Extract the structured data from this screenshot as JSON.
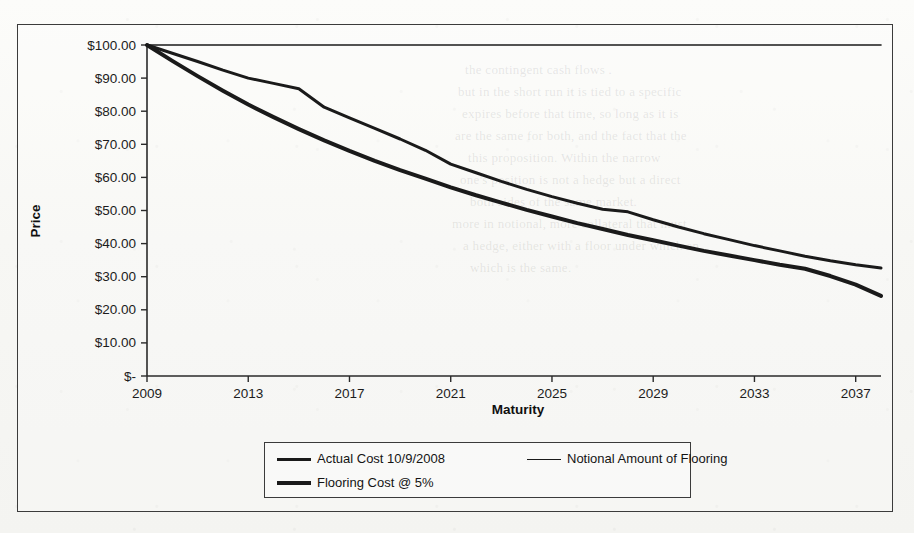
{
  "chart_data": {
    "type": "line",
    "title": "",
    "xlabel": "Maturity",
    "ylabel": "Price",
    "grid": false,
    "legend_position": "bottom",
    "xlim": [
      2009,
      2038
    ],
    "ylim": [
      0,
      100
    ],
    "x_tick_labels": [
      "2009",
      "2013",
      "2017",
      "2021",
      "2025",
      "2029",
      "2033",
      "2037"
    ],
    "x_tick_values": [
      2009,
      2013,
      2017,
      2021,
      2025,
      2029,
      2033,
      2037
    ],
    "y_tick_labels": [
      "$-",
      "$10.00",
      "$20.00",
      "$30.00",
      "$40.00",
      "$50.00",
      "$60.00",
      "$70.00",
      "$80.00",
      "$90.00",
      "$100.00"
    ],
    "y_tick_values": [
      0,
      10,
      20,
      30,
      40,
      50,
      60,
      70,
      80,
      90,
      100
    ],
    "x": [
      2009,
      2010,
      2011,
      2012,
      2013,
      2014,
      2015,
      2016,
      2017,
      2018,
      2019,
      2020,
      2021,
      2022,
      2023,
      2024,
      2025,
      2026,
      2027,
      2028,
      2029,
      2030,
      2031,
      2032,
      2033,
      2034,
      2035,
      2036,
      2037,
      2038
    ],
    "series": [
      {
        "name": "Actual Cost 10/9/2008",
        "style": "medium",
        "values": [
          100.0,
          97.5,
          95.0,
          92.4,
          90.0,
          88.4,
          86.8,
          81.2,
          78.0,
          74.8,
          71.6,
          68.2,
          64.0,
          61.4,
          58.8,
          56.4,
          54.2,
          52.2,
          50.4,
          49.6,
          47.2,
          45.0,
          43.0,
          41.2,
          39.4,
          37.8,
          36.2,
          34.8,
          33.6,
          32.6
        ]
      },
      {
        "name": "Notional Amount of Flooring",
        "style": "thin",
        "values": [
          100.0,
          100.0,
          100.0,
          100.0,
          100.0,
          100.0,
          100.0,
          100.0,
          100.0,
          100.0,
          100.0,
          100.0,
          100.0,
          100.0,
          100.0,
          100.0,
          100.0,
          100.0,
          100.0,
          100.0,
          100.0,
          100.0,
          100.0,
          100.0,
          100.0,
          100.0,
          100.0,
          100.0,
          100.0,
          100.0
        ]
      },
      {
        "name": "Flooring Cost @ 5%",
        "style": "thick",
        "values": [
          100.0,
          95.2,
          90.6,
          86.2,
          82.0,
          78.2,
          74.6,
          71.2,
          68.0,
          65.0,
          62.2,
          59.6,
          57.0,
          54.6,
          52.4,
          50.2,
          48.2,
          46.2,
          44.4,
          42.6,
          41.0,
          39.4,
          37.8,
          36.4,
          35.0,
          33.6,
          32.4,
          30.2,
          27.6,
          24.2
        ]
      }
    ]
  },
  "legend": {
    "entries": [
      {
        "label": "Actual Cost 10/9/2008",
        "swatch": "line-medium"
      },
      {
        "label": "Notional Amount of Flooring",
        "swatch": "line-thin"
      },
      {
        "label": "Flooring Cost @ 5%",
        "swatch": "line-thick"
      }
    ]
  },
  "colors": {
    "line": "#1a1a1a",
    "axis": "#2a2a2a",
    "border": "#3b3b3b",
    "text": "#141414",
    "background": "#f7f7f4"
  },
  "background_text": {
    "lines": [
      "the contingent cash flows .",
      "but in the short run it is tied to a specific",
      "expires before that time, so long as it is",
      "are the same for both, and the fact that the",
      "this proposition. Within the narrow",
      "one's position is not a hedge but a direct",
      "both sides of the same market.",
      "more in notional, more collateral that must",
      "a hedge, either with a floor under which an",
      "which is the same."
    ]
  }
}
